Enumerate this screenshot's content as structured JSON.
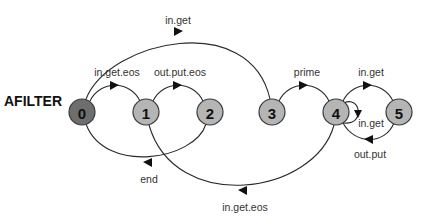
{
  "title": "AFILTER",
  "colors": {
    "start_node": "#6e6e6e",
    "node": "#b5b5b5",
    "edge": "#2a2a2a"
  },
  "nodes": [
    {
      "id": "0",
      "label": "0",
      "role": "start"
    },
    {
      "id": "1",
      "label": "1"
    },
    {
      "id": "2",
      "label": "2"
    },
    {
      "id": "3",
      "label": "3"
    },
    {
      "id": "4",
      "label": "4"
    },
    {
      "id": "5",
      "label": "5"
    }
  ],
  "edges": [
    {
      "from": "0",
      "to": "3",
      "label": "in.get"
    },
    {
      "from": "0",
      "to": "1",
      "label": "in.get.eos"
    },
    {
      "from": "1",
      "to": "2",
      "label": "out.put.eos"
    },
    {
      "from": "2",
      "to": "0",
      "label": "end"
    },
    {
      "from": "4",
      "to": "1",
      "label": "in.get.eos"
    },
    {
      "from": "3",
      "to": "4",
      "label": "prime"
    },
    {
      "from": "4",
      "to": "5",
      "label": "in.get"
    },
    {
      "from": "5",
      "to": "4",
      "label": "out.put"
    },
    {
      "from": "4",
      "to": "4",
      "label": "in.get"
    }
  ]
}
